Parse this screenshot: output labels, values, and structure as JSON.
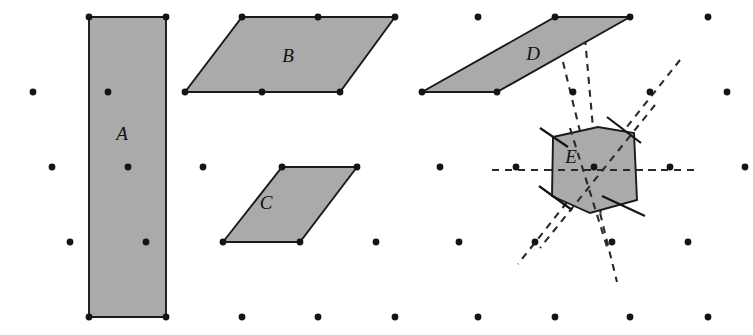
{
  "figure": {
    "width": 753,
    "height": 335,
    "background_color": "#ffffff",
    "shape_fill_color": "#aaaaaa",
    "shape_stroke_color": "#1a1a1a",
    "lattice_dot_color": "#141414",
    "dash_line_color": "#2a2a2a"
  },
  "labels": {
    "a": "A",
    "b": "B",
    "c": "C",
    "d": "D",
    "e": "E"
  },
  "label_positions": {
    "a": {
      "x": 128,
      "y": 140
    },
    "b": {
      "x": 288,
      "y": 62
    },
    "c": {
      "x": 264,
      "y": 208
    },
    "d": {
      "x": 532,
      "y": 58
    },
    "e": {
      "x": 570,
      "y": 160
    }
  },
  "shapes": [
    {
      "id": "shape-a",
      "label": "A",
      "kind": "rectangle",
      "points": "89,17 166,17 166,317 89,317"
    },
    {
      "id": "shape-b",
      "label": "B",
      "kind": "parallelogram",
      "points": "242,17 395,17 340,92 185,92"
    },
    {
      "id": "shape-c",
      "label": "C",
      "kind": "parallelogram",
      "points": "282,167 357,167 300,242 223,242"
    },
    {
      "id": "shape-d",
      "label": "D",
      "kind": "parallelogram",
      "points": "555,17 630,17 497,92 422,92"
    },
    {
      "id": "shape-e",
      "label": "E",
      "kind": "hexagon",
      "points": "553,137 598,127 634,133 637,200 590,213 552,196"
    }
  ],
  "lattice_rows": [
    {
      "y": 17,
      "xs": [
        89,
        166,
        242,
        318,
        395,
        478,
        555,
        630,
        708
      ]
    },
    {
      "y": 19,
      "xs": []
    },
    {
      "y": 92,
      "xs": [
        33,
        108,
        185,
        262,
        340,
        422,
        497,
        573,
        650,
        727
      ]
    },
    {
      "y": 167,
      "xs": [
        52,
        128,
        203,
        282,
        357,
        440,
        516,
        594,
        670,
        745
      ]
    },
    {
      "y": 242,
      "xs": [
        70,
        146,
        223,
        300,
        376,
        459,
        535,
        612,
        688
      ]
    },
    {
      "y": 317,
      "xs": [
        89,
        166,
        242,
        318,
        395,
        478,
        555,
        630,
        708
      ]
    }
  ],
  "dashed_lines": [
    {
      "id": "dash-horizontal",
      "x1": 492,
      "y1": 170,
      "x2": 700,
      "y2": 170
    },
    {
      "id": "dash-steep-left",
      "x1": 563,
      "y1": 62,
      "x2": 617,
      "y2": 280
    },
    {
      "id": "dash-diagonal-up-right",
      "x1": 678,
      "y1": 62,
      "x2": 520,
      "y2": 262
    },
    {
      "id": "dash-through-center-ne",
      "x1": 585,
      "y1": 40,
      "x2": 600,
      "y2": 215
    }
  ],
  "tick_marks": [
    {
      "id": "tick-top-left",
      "x1": 541,
      "y1": 127,
      "x2": 568,
      "y2": 146
    },
    {
      "id": "tick-top-right",
      "x1": 608,
      "y1": 118,
      "x2": 640,
      "y2": 142
    },
    {
      "id": "tick-bottom-left",
      "x1": 541,
      "y1": 186,
      "x2": 570,
      "y2": 208
    },
    {
      "id": "tick-bottom-right",
      "x1": 604,
      "y1": 195,
      "x2": 643,
      "y2": 215
    }
  ],
  "bleed_through_text": [
    {
      "x": 55,
      "y": 160,
      "text": ""
    },
    {
      "x": 170,
      "y": 163,
      "text": ""
    },
    {
      "x": 48,
      "y": 186,
      "text": ""
    },
    {
      "x": 196,
      "y": 186,
      "text": ""
    },
    {
      "x": 42,
      "y": 208,
      "text": ""
    }
  ]
}
